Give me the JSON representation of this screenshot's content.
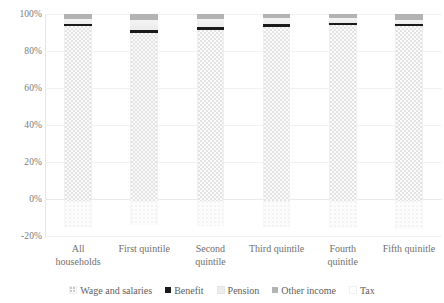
{
  "chart_data": {
    "type": "bar",
    "subtype": "stacked-bar-100-percent",
    "title": "",
    "xlabel": "",
    "ylabel": "",
    "ylim": [
      -20,
      100
    ],
    "ytick_labels": [
      "100%",
      "80%",
      "60%",
      "40%",
      "20%",
      "0%",
      "-20%"
    ],
    "ytick_values": [
      100,
      80,
      60,
      40,
      20,
      0,
      -20
    ],
    "grid": true,
    "grid_axis": "y",
    "legend_position": "bottom",
    "categories": [
      "All households",
      "First quintile",
      "Second quintile",
      "Third quintile",
      "Fourth quinitle",
      "Fifth quinitle"
    ],
    "series": [
      {
        "name": "Wage and salaries",
        "color": "#fbfbfb",
        "values": [
          93.5,
          90.0,
          91.5,
          93.2,
          94.0,
          93.5
        ]
      },
      {
        "name": "Benefit",
        "color": "#1a1a1a",
        "values": [
          1.3,
          1.6,
          1.3,
          1.2,
          1.0,
          0.9
        ]
      },
      {
        "name": "Pension",
        "color": "#efefef",
        "values": [
          2.7,
          5.0,
          4.5,
          3.3,
          2.8,
          2.4
        ]
      },
      {
        "name": "Other income",
        "color": "#b3b3b3",
        "values": [
          2.5,
          3.4,
          2.7,
          2.3,
          2.2,
          3.2
        ]
      },
      {
        "name": "Tax",
        "color": "#fcfcfc",
        "values": [
          -14.0,
          -13.0,
          -13.5,
          -14.0,
          -14.5,
          -15.0
        ]
      }
    ]
  },
  "legend": {
    "items": [
      {
        "label": "Wage and salaries",
        "swatch": "wages-swatch-icon"
      },
      {
        "label": "Benefit",
        "swatch": "benefit-swatch-icon"
      },
      {
        "label": "Pension",
        "swatch": "pension-swatch-icon"
      },
      {
        "label": "Other income",
        "swatch": "other-income-swatch-icon"
      },
      {
        "label": "Tax",
        "swatch": "tax-swatch-icon"
      }
    ]
  },
  "axis": {
    "y_ticks": [
      "100%",
      "80%",
      "60%",
      "40%",
      "20%",
      "0%",
      "-20%"
    ],
    "x_labels": [
      {
        "line1": "All",
        "line2": "households"
      },
      {
        "line1": "First quintile",
        "line2": ""
      },
      {
        "line1": "Second",
        "line2": "quintile"
      },
      {
        "line1": "Third quintile",
        "line2": ""
      },
      {
        "line1": "Fourth",
        "line2": "quinitle"
      },
      {
        "line1": "Fifth quinitle",
        "line2": ""
      }
    ]
  }
}
